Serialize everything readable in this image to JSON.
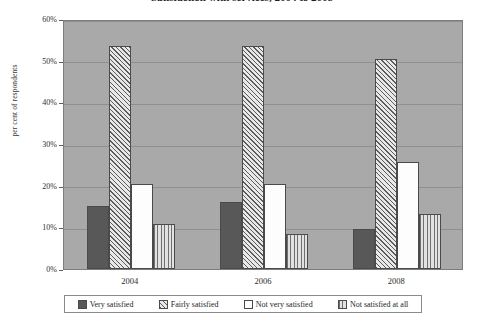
{
  "chart_data": {
    "type": "bar",
    "title": "Satisfaction with services, 2004 to 2008",
    "xlabel": "",
    "ylabel": "per cent of respondents",
    "categories": [
      "2004",
      "2006",
      "2008"
    ],
    "series": [
      {
        "name": "Very satisfied",
        "values": [
          15.2,
          16.0,
          9.6
        ]
      },
      {
        "name": "Fairly satisfied",
        "values": [
          53.5,
          53.6,
          50.5
        ]
      },
      {
        "name": "Not very satisfied",
        "values": [
          20.4,
          20.3,
          25.8
        ]
      },
      {
        "name": "Not satisfied at all",
        "values": [
          10.7,
          8.3,
          13.2
        ]
      }
    ],
    "ylim": [
      0,
      60
    ],
    "y_ticks": [
      "0%",
      "10%",
      "20%",
      "30%",
      "40%",
      "50%",
      "60%"
    ],
    "y_tick_values": [
      0,
      10,
      20,
      30,
      40,
      50,
      60
    ],
    "grid": true,
    "legend_position": "bottom",
    "colors": {
      "very_satisfied": "#585858",
      "fairly_satisfied": "#9a9a9a",
      "not_very_satisfied": "#fdfdfd",
      "not_satisfied_at_all": "#c9c9c9",
      "plot_background": "#a9a9a9",
      "gridline": "#8f8f8f",
      "bar_outline": "#4a4a4a"
    }
  },
  "legend": {
    "items": [
      {
        "label": "Very satisfied"
      },
      {
        "label": "Fairly satisfied"
      },
      {
        "label": "Not very satisfied"
      },
      {
        "label": "Not satisfied at all"
      }
    ]
  }
}
